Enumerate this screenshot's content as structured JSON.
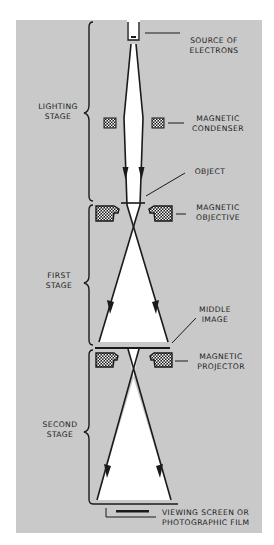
{
  "diagram": {
    "colors": {
      "background": "#c9c9c9",
      "beam": "#ffffff",
      "ink": "#1a1a1a"
    },
    "stages": [
      {
        "id": "lighting",
        "line1": "LIGHTING",
        "line2": "STAGE"
      },
      {
        "id": "first",
        "line1": "FIRST",
        "line2": "STAGE"
      },
      {
        "id": "second",
        "line1": "SECOND",
        "line2": "STAGE"
      }
    ],
    "components": [
      {
        "id": "source",
        "line1": "SOURCE OF",
        "line2": "ELECTRONS"
      },
      {
        "id": "condenser",
        "line1": "MAGNETIC",
        "line2": "CONDENSER"
      },
      {
        "id": "object",
        "line1": "OBJECT",
        "line2": ""
      },
      {
        "id": "objective",
        "line1": "MAGNETIC",
        "line2": "OBJECTIVE"
      },
      {
        "id": "middle-image",
        "line1": "MIDDLE",
        "line2": "IMAGE"
      },
      {
        "id": "projector",
        "line1": "MAGNETIC",
        "line2": "PROJECTOR"
      },
      {
        "id": "screen",
        "line1": "VIEWING SCREEN OR",
        "line2": "PHOTOGRAPHIC FILM"
      }
    ]
  }
}
